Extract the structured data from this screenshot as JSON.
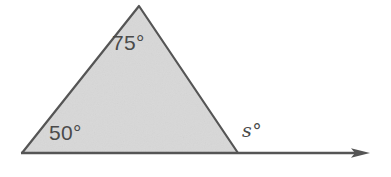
{
  "figure": {
    "type": "triangle-with-exterior-angle",
    "background_color": "#ffffff",
    "fill_color": "#d8d8d8",
    "stroke_color": "#555555",
    "label_color": "#4a4a4a",
    "labels": {
      "apex_angle": "75°",
      "left_base_angle": "50°",
      "exterior_angle": "s°"
    },
    "geometry": {
      "left_vertex": [
        22,
        153
      ],
      "apex_vertex": [
        139,
        6
      ],
      "right_vertex": [
        238,
        153
      ],
      "ray_end": [
        370,
        153
      ]
    }
  }
}
